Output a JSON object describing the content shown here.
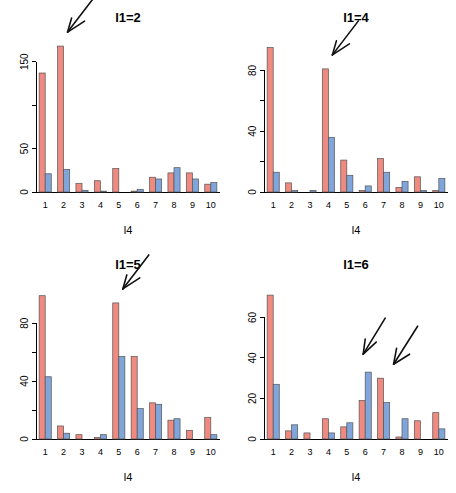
{
  "figure": {
    "background": "#ffffff",
    "width": 456,
    "height": 493,
    "layout": "2x2 grid of grouped bar panels"
  },
  "colors": {
    "series_red": "#EE8A80",
    "series_blue": "#7FA5DA",
    "bar_border": "#555555",
    "axis": "#000000",
    "arrow": "#111111"
  },
  "chart_data": [
    {
      "type": "bar",
      "title": "l1=2",
      "xlabel": "l4",
      "ylabel": "",
      "categories": [
        "1",
        "2",
        "3",
        "4",
        "5",
        "6",
        "7",
        "8",
        "9",
        "10"
      ],
      "series": [
        {
          "name": "red",
          "color": "#EE8A80",
          "values": [
            137,
            168,
            10,
            13,
            27,
            1,
            17,
            22,
            22,
            9
          ]
        },
        {
          "name": "blue",
          "color": "#7FA5DA",
          "values": [
            21,
            26,
            2,
            1,
            0,
            3,
            15,
            28,
            15,
            11
          ]
        }
      ],
      "ylim": [
        0,
        175
      ],
      "yticks": [
        0,
        50,
        100,
        150
      ],
      "ytick_labels": [
        "0",
        "50",
        "",
        "150"
      ],
      "grid": false,
      "legend": "none",
      "annotations": [
        {
          "kind": "arrow",
          "label": "single-arrow",
          "points_to_category": "2"
        }
      ]
    },
    {
      "type": "bar",
      "title": "l1=4",
      "xlabel": "l4",
      "ylabel": "",
      "categories": [
        "1",
        "2",
        "3",
        "4",
        "5",
        "6",
        "7",
        "8",
        "9",
        "10"
      ],
      "series": [
        {
          "name": "red",
          "color": "#EE8A80",
          "values": [
            95,
            6,
            0,
            81,
            21,
            1,
            22,
            3,
            10,
            1
          ]
        },
        {
          "name": "blue",
          "color": "#7FA5DA",
          "values": [
            13,
            1,
            1,
            36,
            11,
            4,
            13,
            7,
            1,
            9
          ]
        }
      ],
      "ylim": [
        0,
        100
      ],
      "yticks": [
        0,
        20,
        40,
        60,
        80
      ],
      "ytick_labels": [
        "0",
        "",
        "40",
        "",
        "80"
      ],
      "grid": false,
      "legend": "none",
      "annotations": [
        {
          "kind": "arrow",
          "label": "single-arrow",
          "points_to_category": "4"
        }
      ]
    },
    {
      "type": "bar",
      "title": "l1=5",
      "xlabel": "l4",
      "ylabel": "",
      "categories": [
        "1",
        "2",
        "3",
        "4",
        "5",
        "6",
        "7",
        "8",
        "9",
        "10"
      ],
      "series": [
        {
          "name": "red",
          "color": "#EE8A80",
          "values": [
            99,
            9,
            3,
            1,
            94,
            57,
            25,
            13,
            6,
            15
          ]
        },
        {
          "name": "blue",
          "color": "#7FA5DA",
          "values": [
            43,
            4,
            0,
            3,
            57,
            21,
            24,
            14,
            0,
            3
          ]
        }
      ],
      "ylim": [
        0,
        105
      ],
      "yticks": [
        0,
        20,
        40,
        60,
        80
      ],
      "ytick_labels": [
        "0",
        "",
        "40",
        "",
        "80"
      ],
      "grid": false,
      "legend": "none",
      "annotations": [
        {
          "kind": "arrow",
          "label": "single-arrow",
          "points_to_category": "5"
        }
      ]
    },
    {
      "type": "bar",
      "title": "l1=6",
      "xlabel": "l4",
      "ylabel": "",
      "categories": [
        "1",
        "2",
        "3",
        "4",
        "5",
        "6",
        "7",
        "8",
        "9",
        "10"
      ],
      "series": [
        {
          "name": "red",
          "color": "#EE8A80",
          "values": [
            71,
            4,
            3,
            10,
            6,
            19,
            30,
            1,
            9,
            13
          ]
        },
        {
          "name": "blue",
          "color": "#7FA5DA",
          "values": [
            27,
            7,
            0,
            3,
            8,
            33,
            18,
            10,
            0,
            5
          ]
        }
      ],
      "ylim": [
        0,
        75
      ],
      "yticks": [
        0,
        20,
        40,
        60
      ],
      "ytick_labels": [
        "0",
        "20",
        "40",
        "60"
      ],
      "grid": false,
      "legend": "none",
      "annotations": [
        {
          "kind": "arrow",
          "label": "double-arrow-left",
          "points_to_category": "6"
        },
        {
          "kind": "arrow",
          "label": "double-arrow-right",
          "points_to_category": "7"
        }
      ]
    }
  ]
}
